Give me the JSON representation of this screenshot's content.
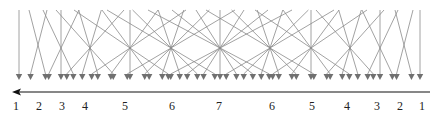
{
  "diagram": {
    "line_color": "#8a8a8a",
    "arrow_color": "#707070",
    "axis_color": "#111111",
    "axis": {
      "y": 92,
      "x_start": 430,
      "x_end": 12,
      "direction": "left"
    },
    "top_y": 10,
    "tip_y": 79,
    "groups": [
      {
        "label": "1",
        "n": 1,
        "center": 19,
        "cross_y": 45,
        "spread_top": 0,
        "spread_bottom": 0
      },
      {
        "label": "2",
        "n": 2,
        "center": 38,
        "cross_y": 45,
        "spread_top": 9,
        "spread_bottom": 9
      },
      {
        "label": "3",
        "n": 3,
        "center": 61,
        "cross_y": 48,
        "spread_top": 18,
        "spread_bottom": 18
      },
      {
        "label": "4",
        "n": 4,
        "center": 90,
        "cross_y": 48,
        "spread_top": 34,
        "spread_bottom": 34
      },
      {
        "label": "5",
        "n": 5,
        "center": 130,
        "cross_y": 48,
        "spread_top": 56,
        "spread_bottom": 56
      },
      {
        "label": "6",
        "n": 6,
        "center": 171,
        "cross_y": 48,
        "spread_top": 64,
        "spread_bottom": 64
      },
      {
        "label": "7",
        "n": 7,
        "center": 220,
        "cross_y": 48,
        "spread_top": 72,
        "spread_bottom": 72
      },
      {
        "label": "6",
        "n": 6,
        "center": 270,
        "cross_y": 48,
        "spread_top": 64,
        "spread_bottom": 64
      },
      {
        "label": "5",
        "n": 5,
        "center": 311,
        "cross_y": 48,
        "spread_top": 56,
        "spread_bottom": 56
      },
      {
        "label": "4",
        "n": 4,
        "center": 350,
        "cross_y": 48,
        "spread_top": 34,
        "spread_bottom": 34
      },
      {
        "label": "3",
        "n": 3,
        "center": 380,
        "cross_y": 48,
        "spread_top": 18,
        "spread_bottom": 18
      },
      {
        "label": "2",
        "n": 2,
        "center": 404,
        "cross_y": 45,
        "spread_top": 9,
        "spread_bottom": 9
      },
      {
        "label": "1",
        "n": 1,
        "center": 420,
        "cross_y": 45,
        "spread_top": 0,
        "spread_bottom": 0
      }
    ],
    "labels": [
      {
        "text": "1",
        "x": 16
      },
      {
        "text": "2",
        "x": 39
      },
      {
        "text": "3",
        "x": 62
      },
      {
        "text": "4",
        "x": 85
      },
      {
        "text": "5",
        "x": 125
      },
      {
        "text": "6",
        "x": 172
      },
      {
        "text": "7",
        "x": 219
      },
      {
        "text": "6",
        "x": 272
      },
      {
        "text": "5",
        "x": 312
      },
      {
        "text": "4",
        "x": 347
      },
      {
        "text": "3",
        "x": 377
      },
      {
        "text": "2",
        "x": 400
      },
      {
        "text": "1",
        "x": 422
      }
    ]
  }
}
